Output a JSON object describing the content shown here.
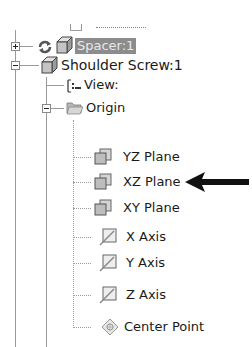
{
  "tree": {
    "partial_top_item": {
      "label": "..."
    },
    "items": [
      {
        "id": "spacer",
        "label": "Spacer:1",
        "selected": true,
        "expanded": false,
        "icon": "part-cube-icon",
        "status_icon": "update-cycle-icon"
      },
      {
        "id": "shoulder-screw",
        "label": "Shoulder Screw:1",
        "expanded": true,
        "icon": "part-cube-icon"
      },
      {
        "id": "view",
        "label": "View:",
        "icon": "view-representation-icon"
      },
      {
        "id": "origin",
        "label": "Origin",
        "expanded": true,
        "icon": "folder-icon"
      },
      {
        "id": "yz-plane",
        "label": "YZ Plane",
        "icon": "work-plane-icon"
      },
      {
        "id": "xz-plane",
        "label": "XZ Plane",
        "icon": "work-plane-icon",
        "annotated": true
      },
      {
        "id": "xy-plane",
        "label": "XY Plane",
        "icon": "work-plane-icon"
      },
      {
        "id": "x-axis",
        "label": "X Axis",
        "icon": "work-axis-icon"
      },
      {
        "id": "y-axis",
        "label": "Y Axis",
        "icon": "work-axis-icon"
      },
      {
        "id": "z-axis",
        "label": "Z Axis",
        "icon": "work-axis-icon"
      },
      {
        "id": "center-point",
        "label": "Center Point",
        "icon": "work-point-icon"
      }
    ]
  },
  "annotation": {
    "type": "arrow",
    "direction": "left",
    "points_to": "XZ Plane",
    "color": "#111111"
  },
  "colors": {
    "selection_bg": "#8c8c8c",
    "tree_lines": "#9a9a9a",
    "text": "#1a1a1a"
  }
}
